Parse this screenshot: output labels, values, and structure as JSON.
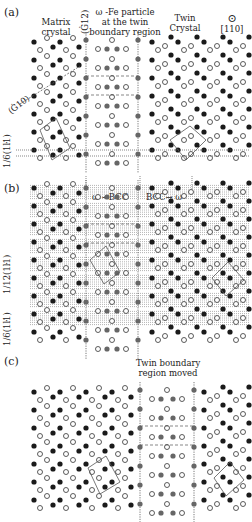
{
  "panels": [
    {
      "label": "(a)",
      "matrix_label_1": "Matrix",
      "matrix_label_2": "crystal",
      "direction_112": "(Ġ12)",
      "boundary_label_1": "ω -Fe particle",
      "boundary_label_2": "at the twin",
      "boundary_label_3": "boundary region",
      "twin_label_1": "Twin",
      "twin_label_2": "Crystal",
      "zone_axis_symbol": "⊙",
      "zone_axis": "[110]",
      "plane_label": "(Ġ10)",
      "spacing_label": "1/6(1ŀ1)"
    },
    {
      "label": "(b)",
      "transform_left": "ω →BCC",
      "transform_right": "BCC→ ω",
      "spacing_label_1": "1/12(1ŀ1)",
      "spacing_label_2": "1/6(1ŀ1)"
    },
    {
      "label": "(c)",
      "moved_label_1": "Twin boundary",
      "moved_label_2": "region moved"
    }
  ],
  "colors": {
    "black_atom": "#1a1a1a",
    "gray_atom": "#666666",
    "open_atom_stroke": "#333333",
    "line": "#555555"
  }
}
